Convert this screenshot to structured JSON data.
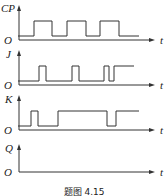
{
  "caption": "题图 4.15",
  "origin_label": "O",
  "time_label": "t",
  "signals": [
    {
      "name": "CP",
      "y_axis_label": "CP",
      "baseline_y": 36,
      "high_y": 21,
      "points": [
        [
          18,
          36
        ],
        [
          34,
          36
        ],
        [
          34,
          21
        ],
        [
          52,
          21
        ],
        [
          52,
          36
        ],
        [
          67,
          36
        ],
        [
          67,
          21
        ],
        [
          86,
          21
        ],
        [
          86,
          36
        ],
        [
          100,
          36
        ],
        [
          100,
          21
        ],
        [
          119,
          21
        ],
        [
          119,
          36
        ],
        [
          139,
          36
        ]
      ]
    },
    {
      "name": "J",
      "y_axis_label": "J",
      "baseline_y": 81,
      "high_y": 66,
      "points": [
        [
          18,
          81
        ],
        [
          39,
          81
        ],
        [
          39,
          66
        ],
        [
          46,
          66
        ],
        [
          46,
          81
        ],
        [
          72,
          81
        ],
        [
          72,
          66
        ],
        [
          79,
          66
        ],
        [
          79,
          81
        ],
        [
          104,
          81
        ],
        [
          104,
          66
        ],
        [
          109,
          66
        ],
        [
          109,
          81
        ],
        [
          114,
          81
        ],
        [
          114,
          66
        ],
        [
          134,
          66
        ]
      ]
    },
    {
      "name": "K",
      "y_axis_label": "K",
      "baseline_y": 126,
      "high_y": 111,
      "points": [
        [
          18,
          126
        ],
        [
          31,
          126
        ],
        [
          31,
          111
        ],
        [
          38,
          111
        ],
        [
          38,
          126
        ],
        [
          58,
          126
        ],
        [
          58,
          111
        ],
        [
          107,
          111
        ],
        [
          107,
          126
        ],
        [
          116,
          126
        ],
        [
          116,
          111
        ],
        [
          139,
          111
        ]
      ]
    },
    {
      "name": "Q",
      "y_axis_label": "Q",
      "baseline_y": 171,
      "high_y": 156,
      "points": []
    }
  ]
}
